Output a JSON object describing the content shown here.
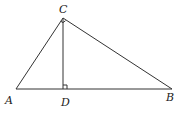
{
  "diagram": {
    "type": "geometry",
    "points": {
      "A": {
        "label": "A",
        "x": 16,
        "y": 89
      },
      "B": {
        "label": "B",
        "x": 172,
        "y": 89
      },
      "C": {
        "label": "C",
        "x": 63,
        "y": 18
      },
      "D": {
        "label": "D",
        "x": 63,
        "y": 89
      }
    },
    "segments": [
      "AB",
      "AC",
      "BC",
      "CD"
    ],
    "right_angles": [
      "C",
      "D"
    ],
    "line_color": "#333333"
  }
}
